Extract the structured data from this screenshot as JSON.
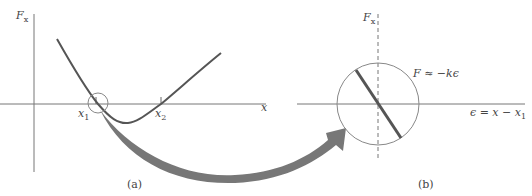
{
  "panel_a": {
    "y_axis_label": "F",
    "y_axis_sub": "x",
    "x_axis_label": "x",
    "x1_label": "x",
    "x1_sub": "1",
    "x2_label": "x",
    "x2_sub": "2",
    "caption": "(a)"
  },
  "panel_b": {
    "y_axis_label": "F",
    "y_axis_sub": "x",
    "x_axis_label": "ϵ = x − x",
    "x_axis_sub": "1",
    "equation": "F ≈ −kϵ",
    "caption": "(b)"
  },
  "colors": {
    "axis": "#777777",
    "curve": "#555555",
    "arrow": "#777777",
    "circle": "#888888"
  }
}
